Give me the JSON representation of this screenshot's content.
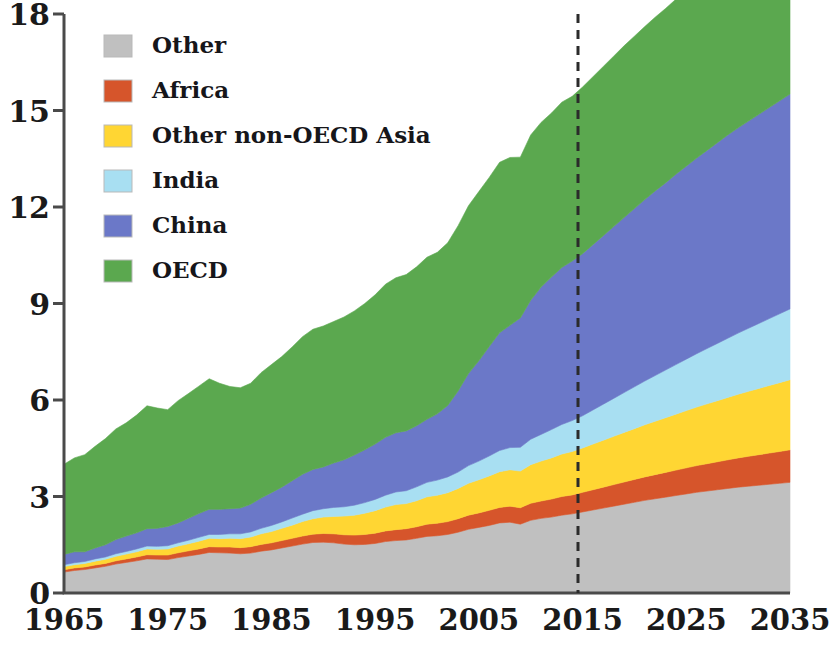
{
  "chart_data": {
    "type": "area",
    "stacked": true,
    "title": "",
    "subtitle": "",
    "xlabel": "",
    "ylabel": "",
    "xlim": [
      1965,
      2035
    ],
    "ylim": [
      0,
      18
    ],
    "yticks": [
      0,
      3,
      6,
      9,
      12,
      15,
      18
    ],
    "xticks": [
      1965,
      1975,
      1985,
      1995,
      2005,
      2015,
      2025,
      2035
    ],
    "grid": false,
    "legend_position": "top-left",
    "annotations": [
      {
        "name": "forecast-divider",
        "type": "vline",
        "x": 2015,
        "style": "dashed"
      }
    ],
    "x": [
      1965,
      1966,
      1967,
      1968,
      1969,
      1970,
      1971,
      1972,
      1973,
      1974,
      1975,
      1976,
      1977,
      1978,
      1979,
      1980,
      1981,
      1982,
      1983,
      1984,
      1985,
      1986,
      1987,
      1988,
      1989,
      1990,
      1991,
      1992,
      1993,
      1994,
      1995,
      1996,
      1997,
      1998,
      1999,
      2000,
      2001,
      2002,
      2003,
      2004,
      2005,
      2006,
      2007,
      2008,
      2009,
      2010,
      2011,
      2012,
      2013,
      2014,
      2015,
      2016,
      2017,
      2018,
      2019,
      2020,
      2021,
      2022,
      2023,
      2024,
      2025,
      2026,
      2027,
      2028,
      2029,
      2030,
      2031,
      2032,
      2033,
      2034,
      2035
    ],
    "series": [
      {
        "name": "OECD",
        "color": "#5ba84f",
        "values": [
          2.8,
          2.92,
          3.02,
          3.16,
          3.3,
          3.44,
          3.52,
          3.66,
          3.82,
          3.74,
          3.63,
          3.8,
          3.88,
          3.96,
          4.06,
          3.92,
          3.8,
          3.74,
          3.76,
          3.9,
          3.98,
          4.06,
          4.16,
          4.28,
          4.36,
          4.38,
          4.4,
          4.44,
          4.48,
          4.55,
          4.64,
          4.76,
          4.82,
          4.86,
          4.94,
          5.04,
          5.02,
          5.06,
          5.14,
          5.22,
          5.26,
          5.26,
          5.3,
          5.22,
          5.0,
          5.14,
          5.12,
          5.1,
          5.14,
          5.12,
          5.18,
          5.22,
          5.26,
          5.3,
          5.34,
          5.36,
          5.38,
          5.4,
          5.42,
          5.44,
          5.46,
          5.47,
          5.48,
          5.49,
          5.5,
          5.5,
          5.5,
          5.5,
          5.5,
          5.49,
          5.48
        ]
      },
      {
        "name": "China",
        "color": "#6b78c8",
        "values": [
          0.32,
          0.34,
          0.3,
          0.34,
          0.38,
          0.44,
          0.48,
          0.5,
          0.54,
          0.56,
          0.6,
          0.62,
          0.68,
          0.74,
          0.78,
          0.78,
          0.78,
          0.8,
          0.86,
          0.94,
          1.02,
          1.08,
          1.16,
          1.24,
          1.28,
          1.3,
          1.38,
          1.46,
          1.56,
          1.64,
          1.72,
          1.8,
          1.84,
          1.86,
          1.9,
          1.96,
          2.06,
          2.22,
          2.52,
          2.86,
          3.12,
          3.4,
          3.66,
          3.8,
          4.02,
          4.32,
          4.58,
          4.74,
          4.88,
          4.96,
          5.04,
          5.14,
          5.24,
          5.34,
          5.44,
          5.54,
          5.64,
          5.74,
          5.82,
          5.92,
          6.0,
          6.08,
          6.16,
          6.24,
          6.32,
          6.38,
          6.44,
          6.5,
          6.56,
          6.62,
          6.68
        ]
      },
      {
        "name": "India",
        "color": "#a8dff2",
        "values": [
          0.06,
          0.06,
          0.06,
          0.07,
          0.07,
          0.08,
          0.08,
          0.09,
          0.09,
          0.09,
          0.1,
          0.1,
          0.11,
          0.12,
          0.12,
          0.13,
          0.14,
          0.15,
          0.16,
          0.17,
          0.19,
          0.2,
          0.22,
          0.23,
          0.25,
          0.26,
          0.28,
          0.29,
          0.31,
          0.33,
          0.35,
          0.37,
          0.39,
          0.4,
          0.43,
          0.45,
          0.47,
          0.49,
          0.51,
          0.55,
          0.58,
          0.62,
          0.66,
          0.69,
          0.74,
          0.79,
          0.83,
          0.88,
          0.92,
          0.96,
          1.0,
          1.06,
          1.12,
          1.18,
          1.24,
          1.3,
          1.36,
          1.42,
          1.48,
          1.54,
          1.6,
          1.66,
          1.72,
          1.78,
          1.84,
          1.9,
          1.96,
          2.02,
          2.08,
          2.14,
          2.2
        ]
      },
      {
        "name": "Other non-OECD Asia",
        "color": "#ffd633",
        "values": [
          0.1,
          0.1,
          0.11,
          0.12,
          0.13,
          0.14,
          0.15,
          0.16,
          0.18,
          0.18,
          0.19,
          0.21,
          0.22,
          0.24,
          0.26,
          0.26,
          0.27,
          0.28,
          0.3,
          0.33,
          0.35,
          0.38,
          0.41,
          0.45,
          0.48,
          0.51,
          0.54,
          0.58,
          0.62,
          0.66,
          0.7,
          0.74,
          0.78,
          0.78,
          0.81,
          0.85,
          0.87,
          0.9,
          0.94,
          0.99,
          1.03,
          1.07,
          1.11,
          1.13,
          1.14,
          1.2,
          1.24,
          1.28,
          1.32,
          1.35,
          1.38,
          1.42,
          1.46,
          1.5,
          1.54,
          1.58,
          1.62,
          1.66,
          1.7,
          1.74,
          1.78,
          1.82,
          1.86,
          1.9,
          1.94,
          1.98,
          2.02,
          2.06,
          2.1,
          2.14,
          2.18
        ]
      },
      {
        "name": "Africa",
        "color": "#d6552b",
        "values": [
          0.07,
          0.08,
          0.08,
          0.09,
          0.09,
          0.1,
          0.11,
          0.12,
          0.13,
          0.13,
          0.14,
          0.15,
          0.16,
          0.17,
          0.18,
          0.18,
          0.19,
          0.19,
          0.2,
          0.21,
          0.22,
          0.23,
          0.24,
          0.25,
          0.26,
          0.27,
          0.28,
          0.29,
          0.3,
          0.31,
          0.32,
          0.33,
          0.34,
          0.35,
          0.36,
          0.38,
          0.39,
          0.4,
          0.42,
          0.44,
          0.45,
          0.47,
          0.48,
          0.5,
          0.51,
          0.53,
          0.54,
          0.56,
          0.58,
          0.59,
          0.61,
          0.63,
          0.65,
          0.67,
          0.69,
          0.71,
          0.73,
          0.75,
          0.77,
          0.79,
          0.81,
          0.83,
          0.85,
          0.87,
          0.89,
          0.91,
          0.93,
          0.95,
          0.97,
          0.99,
          1.01
        ]
      },
      {
        "name": "Other",
        "color": "#c0c0c0",
        "values": [
          0.65,
          0.7,
          0.73,
          0.78,
          0.83,
          0.9,
          0.95,
          1.0,
          1.06,
          1.05,
          1.04,
          1.1,
          1.15,
          1.2,
          1.26,
          1.25,
          1.24,
          1.22,
          1.24,
          1.3,
          1.34,
          1.4,
          1.46,
          1.52,
          1.57,
          1.58,
          1.56,
          1.52,
          1.5,
          1.51,
          1.54,
          1.6,
          1.63,
          1.65,
          1.7,
          1.76,
          1.78,
          1.82,
          1.89,
          1.98,
          2.04,
          2.1,
          2.18,
          2.2,
          2.14,
          2.26,
          2.32,
          2.36,
          2.42,
          2.46,
          2.52,
          2.58,
          2.64,
          2.7,
          2.76,
          2.82,
          2.88,
          2.93,
          2.98,
          3.03,
          3.08,
          3.13,
          3.17,
          3.21,
          3.25,
          3.29,
          3.32,
          3.35,
          3.38,
          3.41,
          3.44
        ]
      }
    ],
    "totals_note": "",
    "legend_entries": [
      {
        "label": "Other",
        "color": "#c0c0c0"
      },
      {
        "label": "Africa",
        "color": "#d6552b"
      },
      {
        "label": "Other non-OECD Asia",
        "color": "#ffd633"
      },
      {
        "label": "India",
        "color": "#a8dff2"
      },
      {
        "label": "China",
        "color": "#6b78c8"
      },
      {
        "label": "OECD",
        "color": "#5ba84f"
      }
    ]
  },
  "axis": {
    "y_labels": [
      "18",
      "15",
      "12",
      "9",
      "6",
      "3",
      "0"
    ],
    "x_labels": [
      "1965",
      "1975",
      "1985",
      "1995",
      "2005",
      "2015",
      "2025",
      "2035"
    ]
  },
  "legend": {
    "items": [
      {
        "label": "Other"
      },
      {
        "label": "Africa"
      },
      {
        "label": "Other non-OECD Asia"
      },
      {
        "label": "India"
      },
      {
        "label": "China"
      },
      {
        "label": "OECD"
      }
    ]
  },
  "colors": {
    "oecd": "#5ba84f",
    "china": "#6b78c8",
    "india": "#a8dff2",
    "other_non_oecd_asia": "#ffd633",
    "africa": "#d6552b",
    "other": "#c0c0c0",
    "axis": "#4a4a4a",
    "text": "#1a1a1a",
    "forecast_line": "#2b2b2b"
  }
}
